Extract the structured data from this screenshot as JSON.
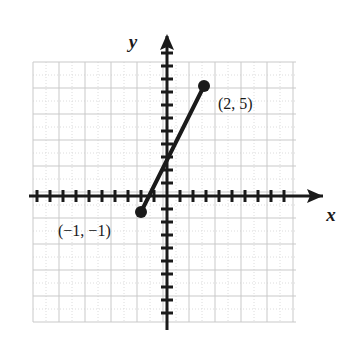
{
  "figure": {
    "kind": "coordinate-plane-line-segment",
    "background_color": "#ffffff",
    "ink_color": "#1a1a1a",
    "grid_major_color": "#c9c9c9",
    "grid_minor_color": "#dcdcdc"
  },
  "axes": {
    "x_label": "x",
    "y_label": "y",
    "x_arrow": true,
    "y_arrow": true,
    "tick_spacing_px": 13,
    "origin_px": {
      "x": 167,
      "y": 196
    },
    "x_axis_ticks_left": 10,
    "x_axis_ticks_right": 9,
    "y_axis_ticks_up": 11,
    "y_axis_ticks_down": 9,
    "tick_half_len_px": 6
  },
  "grid": {
    "left_px": 33,
    "top_px": 62,
    "right_px": 296,
    "bottom_px": 322,
    "major_step_px": 26,
    "minor_step_px": 13
  },
  "chart_data": {
    "type": "line",
    "title": "",
    "xlabel": "x",
    "ylabel": "y",
    "grid": true,
    "legend": "none",
    "xlim": [
      -5,
      5
    ],
    "ylim": [
      -5,
      7
    ],
    "series": [
      {
        "name": "segment",
        "x": [
          -1,
          2
        ],
        "y": [
          -1,
          5
        ],
        "marker": "filled-circle",
        "endpoints_labeled": true
      }
    ],
    "annotations": [
      {
        "text": "(2, 5)",
        "point": [
          2,
          5
        ],
        "position": "right"
      },
      {
        "text": "(−1, −1)",
        "point": [
          -1,
          -1
        ],
        "position": "left"
      }
    ]
  },
  "points": [
    {
      "id": "upper-endpoint",
      "label": "(2, 5)",
      "x": 2,
      "y": 5,
      "px": {
        "x": 204,
        "y": 86
      },
      "label_px": {
        "x": 218,
        "y": 109
      },
      "radius_px": 6
    },
    {
      "id": "lower-endpoint",
      "label": "(−1, −1)",
      "x": -1,
      "y": -1,
      "px": {
        "x": 141,
        "y": 212
      },
      "label_px": {
        "x": 58,
        "y": 236
      },
      "radius_px": 6
    }
  ],
  "segment": {
    "stroke_width_px": 4,
    "from_px": {
      "x": 141,
      "y": 212
    },
    "to_px": {
      "x": 204,
      "y": 86
    }
  }
}
